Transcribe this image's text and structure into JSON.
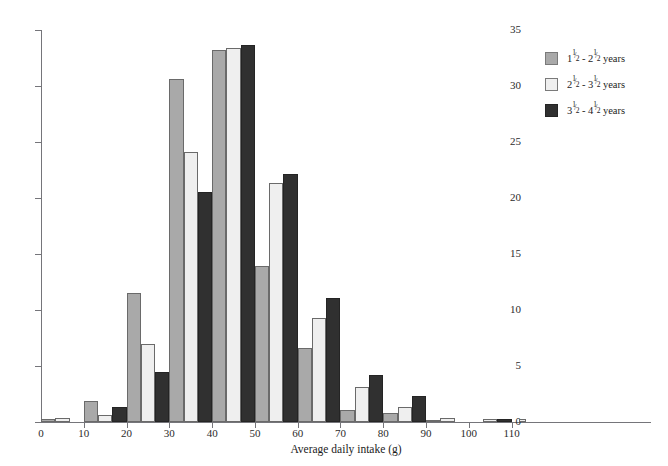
{
  "caption_sliver": "",
  "chart_data": {
    "type": "bar",
    "title": "",
    "xlabel": "Average daily intake (g)",
    "ylabel": "Percentage",
    "xlim": [
      0,
      115
    ],
    "ylim": [
      0,
      35
    ],
    "grid": false,
    "legend_position": "top-right",
    "xticks": [
      0,
      10,
      20,
      30,
      40,
      50,
      60,
      70,
      80,
      90,
      100,
      110
    ],
    "xtick_labels": [
      "0",
      "10",
      "20",
      "30",
      "40",
      "50",
      "60",
      "70",
      "80",
      "90",
      "100",
      "110"
    ],
    "yticks": [
      0,
      5,
      10,
      15,
      20,
      25,
      30,
      35
    ],
    "ytick_labels": [
      "0",
      "5",
      "10",
      "15",
      "20",
      "25",
      "30",
      "35"
    ],
    "bin_width": 10,
    "bin_starts": [
      0,
      10,
      20,
      30,
      40,
      50,
      60,
      70,
      80,
      90,
      100,
      110
    ],
    "categories": [
      "0-10",
      "10-20",
      "20-30",
      "30-40",
      "40-50",
      "50-60",
      "60-70",
      "70-80",
      "80-90",
      "90-100",
      "100-110",
      "110-115"
    ],
    "series": [
      {
        "name": "1 1/2 - 2 1/2 years",
        "color": "#a9a9a9",
        "legend": {
          "whole1": "1",
          "num1": "1",
          "den1": "2",
          "whole2": "2",
          "num2": "1",
          "den2": "2",
          "unit": "years"
        },
        "values": [
          0.3,
          1.9,
          11.5,
          30.6,
          33.2,
          13.9,
          6.6,
          1.1,
          0.8,
          0.2,
          0.0,
          0.0
        ]
      },
      {
        "name": "2 1/2 - 3 1/2 years",
        "color": "#efefef",
        "legend": {
          "whole1": "2",
          "num1": "1",
          "den1": "2",
          "whole2": "3",
          "num2": "1",
          "den2": "2",
          "unit": "years"
        },
        "values": [
          0.4,
          0.6,
          7.0,
          24.1,
          33.4,
          21.3,
          9.3,
          3.1,
          1.3,
          0.4,
          0.3,
          0.3
        ]
      },
      {
        "name": "3 1/2 - 4 1/2 years",
        "color": "#303030",
        "legend": {
          "whole1": "3",
          "num1": "1",
          "den1": "2",
          "whole2": "4",
          "num2": "1",
          "den2": "2",
          "unit": "years"
        },
        "values": [
          0.0,
          1.3,
          4.5,
          20.5,
          33.7,
          22.1,
          11.1,
          4.2,
          2.3,
          0.0,
          0.3,
          0.0
        ]
      }
    ]
  }
}
